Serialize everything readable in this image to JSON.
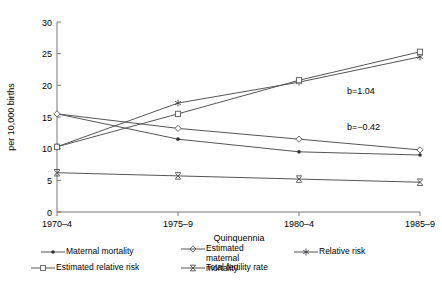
{
  "chart_data": {
    "type": "line",
    "title": "",
    "xlabel": "Quinquennia",
    "ylabel": "per 10,000 births",
    "categories": [
      "1970–4",
      "1975–9",
      "1980–4",
      "1985–9"
    ],
    "ylim": [
      0,
      30
    ],
    "yticks": [
      0,
      5,
      10,
      15,
      20,
      25,
      30
    ],
    "grid": false,
    "legend_position": "bottom",
    "series": [
      {
        "name": "Maternal mortality",
        "marker": "dot",
        "values": [
          15.5,
          11.5,
          9.5,
          9.0
        ]
      },
      {
        "name": "Estimated maternal mortality",
        "marker": "diamond",
        "values": [
          15.5,
          13.2,
          11.5,
          9.8
        ]
      },
      {
        "name": "Relative risk",
        "marker": "asterisk",
        "values": [
          10.3,
          17.2,
          20.5,
          24.5
        ]
      },
      {
        "name": "Estimated relative risk",
        "marker": "square",
        "values": [
          10.3,
          15.5,
          20.8,
          25.3
        ]
      },
      {
        "name": "Total fertility rate",
        "marker": "x-bar",
        "values": [
          6.2,
          5.7,
          5.2,
          4.7
        ]
      }
    ],
    "annotations": [
      {
        "text": "b=1.04",
        "x_frac": 0.8,
        "y_value": 19.0
      },
      {
        "text": "b=−0.42",
        "x_frac": 0.8,
        "y_value": 13.3
      }
    ]
  },
  "axis": {
    "ytick_labels": [
      "0",
      "5",
      "10",
      "15",
      "20",
      "25",
      "30"
    ],
    "xtick_labels": [
      "1970–4",
      "1975–9",
      "1980–4",
      "1985–9"
    ],
    "ylabel": "per 10,000 births",
    "xlabel": "Quinquennia"
  },
  "legend": {
    "entries": [
      {
        "label": "Maternal mortality",
        "marker": "dot-marker-icon"
      },
      {
        "label": "Estimated maternal mortality",
        "marker": "diamond-marker-icon"
      },
      {
        "label": "Relative risk",
        "marker": "asterisk-marker-icon"
      },
      {
        "label": "Estimated relative risk",
        "marker": "square-marker-icon"
      },
      {
        "label": "Total fertility rate",
        "marker": "x-bar-marker-icon"
      }
    ]
  },
  "colors": {
    "line": "#555555",
    "axis": "#777777",
    "text": "#000000"
  }
}
